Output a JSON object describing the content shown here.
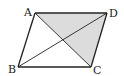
{
  "diagram": {
    "colors": {
      "stroke": "#222222",
      "shade": "#dcdcdc",
      "background": "#ffffff"
    },
    "vertices": {
      "A": {
        "label": "A",
        "x": 35,
        "y": 13,
        "lx": 24,
        "ly": 16
      },
      "D": {
        "label": "D",
        "x": 107,
        "y": 13,
        "lx": 109,
        "ly": 17
      },
      "B": {
        "label": "B",
        "x": 18,
        "y": 67,
        "lx": 8,
        "ly": 73
      },
      "C": {
        "label": "C",
        "x": 91,
        "y": 67,
        "lx": 93,
        "ly": 74
      }
    },
    "shaded_region": [
      "A",
      "D",
      "C"
    ],
    "edges": [
      [
        "A",
        "D"
      ],
      [
        "D",
        "C"
      ],
      [
        "C",
        "B"
      ],
      [
        "B",
        "A"
      ]
    ],
    "diagonals": [
      [
        "A",
        "C"
      ],
      [
        "B",
        "D"
      ]
    ]
  }
}
